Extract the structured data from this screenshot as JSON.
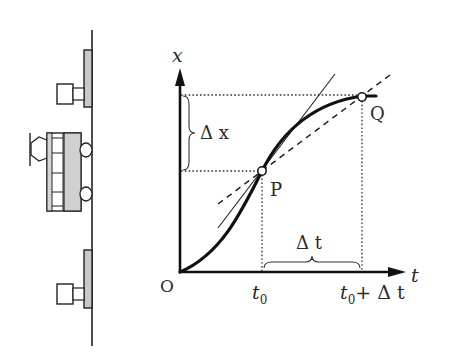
{
  "diagram": {
    "type": "position-time graph with train illustration",
    "axes": {
      "y_label": "x",
      "x_label": "t",
      "origin_label": "O"
    },
    "points": {
      "P": "P",
      "Q": "Q"
    },
    "ticks": {
      "t0": "t",
      "t0_sub": "0",
      "t0_plus": "t",
      "t0_plus_sub": "0",
      "t0_plus_rest": "+ Δ t"
    },
    "brackets": {
      "delta_x": "Δ x",
      "delta_t": "Δ t"
    },
    "lines": {
      "curve": "x(t) position curve",
      "tangent": "tangent at P (thin solid)",
      "secant": "secant PQ (dashed)"
    },
    "colors": {
      "ink": "#222222",
      "fill_gray": "#cccccc",
      "background": "#ffffff"
    }
  }
}
